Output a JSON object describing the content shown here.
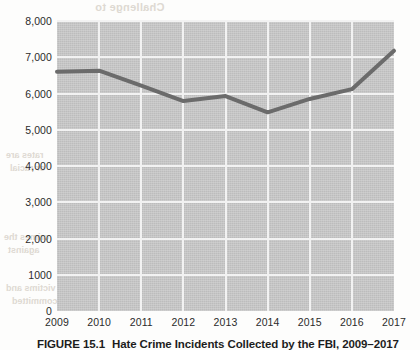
{
  "page": {
    "bleed_through": {
      "title": "Challenge to",
      "lines": [
        "rates are",
        "or racial",
        "crimes the",
        "against",
        "victims and",
        "committed"
      ]
    }
  },
  "figure": {
    "caption_number": "FIGURE 15.1",
    "caption_text": "Hate Crime Incidents Collected by the FBI, 2009–2017"
  },
  "chart_data": {
    "type": "line",
    "title": "Hate Crime Incidents Collected by the FBI, 2009–2017",
    "xlabel": "",
    "ylabel": "",
    "categories": [
      "2009",
      "2010",
      "2011",
      "2012",
      "2013",
      "2014",
      "2015",
      "2016",
      "2017"
    ],
    "values": [
      6600,
      6630,
      6220,
      5790,
      5930,
      5480,
      5850,
      6120,
      7180
    ],
    "ylim": [
      0,
      8000
    ],
    "yticks": [
      0,
      1000,
      2000,
      3000,
      4000,
      5000,
      6000,
      7000,
      8000
    ],
    "ytick_labels": [
      "0",
      "1000",
      "2,000",
      "3,000",
      "4,000",
      "5,000",
      "6,000",
      "7,000",
      "8,000"
    ],
    "grid": true,
    "legend": false,
    "colors": {
      "plot_background": "#c3c3c3",
      "gridline": "#f2f2f2",
      "line": "#6b6b6b",
      "text": "#2b2b2b"
    },
    "line_width": 4
  }
}
